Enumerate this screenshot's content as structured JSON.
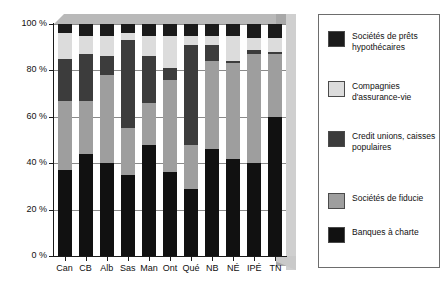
{
  "chart_data": {
    "type": "bar",
    "subtype": "stacked-bar-100-percent",
    "title": "",
    "xlabel": "",
    "ylabel": "",
    "ylim": [
      0,
      100
    ],
    "ytick_labels": [
      "0 %",
      "20 %",
      "40 %",
      "60 %",
      "80 %",
      "100 %"
    ],
    "ytick_values": [
      0,
      20,
      40,
      60,
      80,
      100
    ],
    "grid": true,
    "legend_position": "right",
    "categories": [
      "Can",
      "CB",
      "Alb",
      "Sas",
      "Man",
      "Ont",
      "Qué",
      "NB",
      "NÉ",
      "IPÉ",
      "TN"
    ],
    "series": [
      {
        "name": "Banques à charte",
        "color": "#111111",
        "values": [
          37,
          44,
          40,
          35,
          48,
          36,
          29,
          46,
          42,
          40,
          60
        ]
      },
      {
        "name": "Sociétés de fiducie",
        "color": "#9e9e9e",
        "values": [
          30,
          23,
          38,
          20,
          18,
          40,
          19,
          38,
          41,
          47,
          27
        ]
      },
      {
        "name": "Credit unions, caisses populaires",
        "color": "#3c3c3c",
        "values": [
          18,
          20,
          8,
          38,
          20,
          5,
          43,
          7,
          1,
          2,
          1
        ]
      },
      {
        "name": "Compagnies d'assurance-vie",
        "color": "#dcdcdc",
        "values": [
          11,
          8,
          9,
          3,
          9,
          14,
          4,
          4,
          11,
          5,
          6
        ]
      },
      {
        "name": "Sociétés de prêts hypothécaires",
        "color": "#1b1b1b",
        "values": [
          4,
          5,
          5,
          4,
          5,
          5,
          5,
          5,
          5,
          6,
          6
        ]
      }
    ]
  },
  "legend": {
    "items": [
      {
        "label": "Sociétés de prêts hypothécaires",
        "color": "#1b1b1b"
      },
      {
        "label": "Compagnies d'assurance-vie",
        "color": "#dcdcdc"
      },
      {
        "label": "Credit unions, caisses populaires",
        "color": "#3c3c3c"
      },
      {
        "label": "Sociétés de fiducie",
        "color": "#9e9e9e"
      },
      {
        "label": "Banques à charte",
        "color": "#111111"
      }
    ]
  }
}
